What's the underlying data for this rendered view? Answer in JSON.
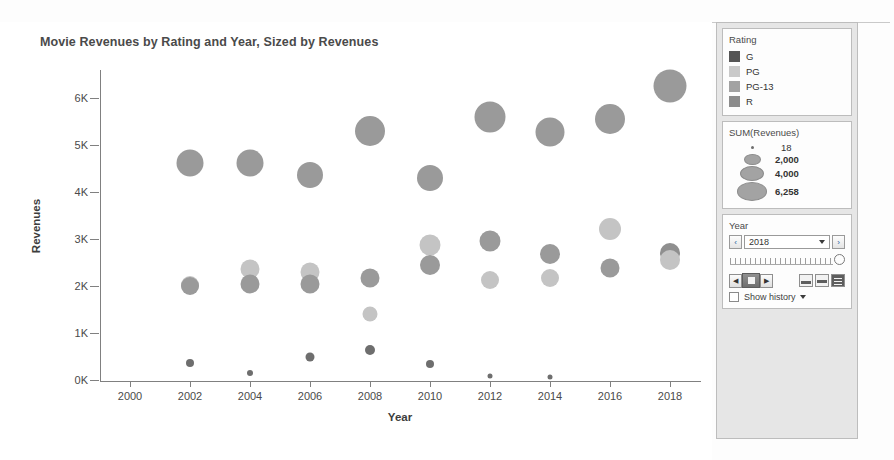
{
  "chart": {
    "title": "Movie Revenues by Rating and Year, Sized by Revenues",
    "xlabel": "Year",
    "ylabel": "Revenues"
  },
  "legend": {
    "rating": {
      "title": "Rating",
      "items": [
        {
          "label": "G",
          "color": "#555555"
        },
        {
          "label": "PG",
          "color": "#c9c9c9"
        },
        {
          "label": "PG-13",
          "color": "#a2a2a2"
        },
        {
          "label": "R",
          "color": "#8c8c8c"
        }
      ]
    },
    "size": {
      "title": "SUM(Revenues)",
      "items": [
        {
          "label": "18",
          "d": 3
        },
        {
          "label": "2,000",
          "d": 17
        },
        {
          "label": "4,000",
          "d": 24
        },
        {
          "label": "6,258",
          "d": 30
        }
      ]
    }
  },
  "year_filter": {
    "title": "Year",
    "prev_label": "‹",
    "next_label": "›",
    "value": "2018",
    "step_back_label": "◀",
    "step_fwd_label": "▶",
    "show_history_label": "Show history"
  },
  "chart_data": {
    "type": "scatter",
    "title": "Movie Revenues by Rating and Year, Sized by Revenues",
    "xlabel": "Year",
    "ylabel": "Revenues",
    "xlim": [
      1999,
      2019
    ],
    "ylim": [
      0,
      6600
    ],
    "xticks": [
      2000,
      2002,
      2004,
      2006,
      2008,
      2010,
      2012,
      2014,
      2016,
      2018
    ],
    "yticks": [
      0,
      1000,
      2000,
      3000,
      4000,
      5000,
      6000
    ],
    "ytick_labels": [
      "0K",
      "1K",
      "2K",
      "3K",
      "4K",
      "5K",
      "6K"
    ],
    "grid": false,
    "legend_position": "right",
    "size_field": "SUM(Revenues)",
    "color_field": "Rating",
    "points": [
      {
        "year": 2002,
        "revenues": 4620,
        "rating": "PG-13",
        "color": "#9a9a9a",
        "d": 27
      },
      {
        "year": 2002,
        "revenues": 2030,
        "rating": "PG",
        "color": "#c4c4c4",
        "d": 18
      },
      {
        "year": 2002,
        "revenues": 2010,
        "rating": "R",
        "color": "#9a9a9a",
        "d": 18
      },
      {
        "year": 2002,
        "revenues": 370,
        "rating": "G",
        "color": "#6e6e6e",
        "d": 8
      },
      {
        "year": 2004,
        "revenues": 4630,
        "rating": "PG-13",
        "color": "#9a9a9a",
        "d": 27
      },
      {
        "year": 2004,
        "revenues": 2360,
        "rating": "PG",
        "color": "#c4c4c4",
        "d": 19
      },
      {
        "year": 2004,
        "revenues": 2050,
        "rating": "R",
        "color": "#9a9a9a",
        "d": 19
      },
      {
        "year": 2004,
        "revenues": 140,
        "rating": "G",
        "color": "#6e6e6e",
        "d": 6
      },
      {
        "year": 2006,
        "revenues": 4370,
        "rating": "PG-13",
        "color": "#9a9a9a",
        "d": 26
      },
      {
        "year": 2006,
        "revenues": 2290,
        "rating": "PG",
        "color": "#c4c4c4",
        "d": 19
      },
      {
        "year": 2006,
        "revenues": 2040,
        "rating": "R",
        "color": "#9a9a9a",
        "d": 19
      },
      {
        "year": 2006,
        "revenues": 490,
        "rating": "G",
        "color": "#6e6e6e",
        "d": 9
      },
      {
        "year": 2008,
        "revenues": 5310,
        "rating": "PG-13",
        "color": "#9a9a9a",
        "d": 30
      },
      {
        "year": 2008,
        "revenues": 2170,
        "rating": "R",
        "color": "#9a9a9a",
        "d": 19
      },
      {
        "year": 2008,
        "revenues": 1400,
        "rating": "PG",
        "color": "#c4c4c4",
        "d": 15
      },
      {
        "year": 2008,
        "revenues": 640,
        "rating": "G",
        "color": "#6e6e6e",
        "d": 10
      },
      {
        "year": 2010,
        "revenues": 4310,
        "rating": "PG-13",
        "color": "#9a9a9a",
        "d": 26
      },
      {
        "year": 2010,
        "revenues": 2880,
        "rating": "PG",
        "color": "#c4c4c4",
        "d": 21
      },
      {
        "year": 2010,
        "revenues": 2450,
        "rating": "R",
        "color": "#9a9a9a",
        "d": 20
      },
      {
        "year": 2010,
        "revenues": 350,
        "rating": "G",
        "color": "#6e6e6e",
        "d": 8
      },
      {
        "year": 2012,
        "revenues": 5610,
        "rating": "PG-13",
        "color": "#9a9a9a",
        "d": 31
      },
      {
        "year": 2012,
        "revenues": 2960,
        "rating": "R",
        "color": "#9a9a9a",
        "d": 21
      },
      {
        "year": 2012,
        "revenues": 2120,
        "rating": "PG",
        "color": "#c4c4c4",
        "d": 18
      },
      {
        "year": 2012,
        "revenues": 90,
        "rating": "G",
        "color": "#6e6e6e",
        "d": 5
      },
      {
        "year": 2014,
        "revenues": 5290,
        "rating": "PG-13",
        "color": "#9a9a9a",
        "d": 29
      },
      {
        "year": 2014,
        "revenues": 2680,
        "rating": "R",
        "color": "#9a9a9a",
        "d": 20
      },
      {
        "year": 2014,
        "revenues": 2170,
        "rating": "PG",
        "color": "#c4c4c4",
        "d": 18
      },
      {
        "year": 2014,
        "revenues": 60,
        "rating": "G",
        "color": "#6e6e6e",
        "d": 5
      },
      {
        "year": 2016,
        "revenues": 5560,
        "rating": "PG-13",
        "color": "#9a9a9a",
        "d": 30
      },
      {
        "year": 2016,
        "revenues": 3210,
        "rating": "PG",
        "color": "#c4c4c4",
        "d": 22
      },
      {
        "year": 2016,
        "revenues": 2380,
        "rating": "R",
        "color": "#9a9a9a",
        "d": 19
      },
      {
        "year": 2018,
        "revenues": 6258,
        "rating": "PG-13",
        "color": "#9a9a9a",
        "d": 33
      },
      {
        "year": 2018,
        "revenues": 2700,
        "rating": "R",
        "color": "#8f8f8f",
        "d": 20
      },
      {
        "year": 2018,
        "revenues": 2560,
        "rating": "PG",
        "color": "#c4c4c4",
        "d": 20
      }
    ]
  }
}
